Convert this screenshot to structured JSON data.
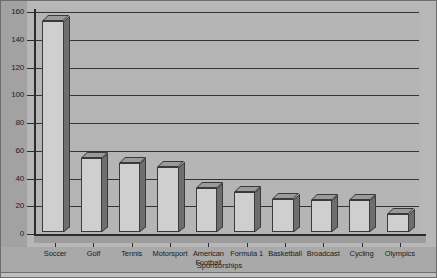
{
  "chart_data": {
    "type": "bar",
    "title": "",
    "xlabel": "Sponsorships",
    "ylabel": "",
    "ylim": [
      0,
      160
    ],
    "ytick_step": 20,
    "yticks": [
      "0",
      "20",
      "40",
      "60",
      "80",
      "100",
      "120",
      "140",
      "160"
    ],
    "grid": true,
    "legend": "none",
    "three_d": true,
    "categories": [
      "Soccer",
      "Golf",
      "Tennis",
      "Motorsport",
      "American Football",
      "Formula 1",
      "Basketball",
      "Broadcast",
      "Cycling",
      "Olympics"
    ],
    "values": [
      152,
      53,
      50,
      47,
      32,
      29,
      24,
      23,
      23,
      13
    ]
  },
  "colors": {
    "background": "#b9b9b9",
    "plot_background": "#b5b5b5",
    "bar_face": "#cfcfcf",
    "bar_side": "#6e6e6e",
    "bar_top": "#9a9a9a",
    "axis": "#2b2b2b",
    "gridline": "#333333",
    "text": "#1c1c1c"
  }
}
